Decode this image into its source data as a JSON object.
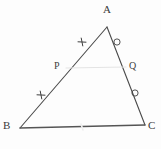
{
  "figure": {
    "name": "triangle-abc-midsegment",
    "background_color": "#fdfdfd",
    "stroke_color": "#4a4a4a",
    "faint_stroke_color": "#e2e2e2",
    "mark_color": "#3f3f3f"
  },
  "vertices": {
    "A": {
      "label": "A",
      "x": 107,
      "y": 27,
      "label_x": 103,
      "label_y": 4
    },
    "B": {
      "label": "B",
      "x": 20,
      "y": 128,
      "label_x": 3,
      "label_y": 120
    },
    "C": {
      "label": "C",
      "x": 145,
      "y": 125,
      "label_x": 148,
      "label_y": 120
    }
  },
  "points": {
    "P": {
      "label": "P",
      "x": 65,
      "y": 77,
      "label_x": 54,
      "label_y": 61
    },
    "Q": {
      "label": "Q",
      "x": 126,
      "y": 76,
      "label_x": 129,
      "label_y": 61
    }
  },
  "segments": [
    {
      "name": "side-ab",
      "from": "A",
      "to": "B",
      "x1": 107,
      "y1": 27,
      "x2": 20,
      "y2": 128,
      "style": "solid"
    },
    {
      "name": "side-ac",
      "from": "A",
      "to": "C",
      "x1": 107,
      "y1": 27,
      "x2": 145,
      "y2": 125,
      "style": "solid"
    },
    {
      "name": "side-bc",
      "from": "B",
      "to": "C",
      "x1": 20,
      "y1": 128,
      "x2": 145,
      "y2": 125,
      "style": "solid"
    },
    {
      "name": "segment-pq",
      "from": "P",
      "to": "Q",
      "x1": 66,
      "y1": 68,
      "x2": 126,
      "y2": 67,
      "style": "faint"
    }
  ],
  "congruence_marks": [
    {
      "name": "tick-mark-ap",
      "type": "cross-tick",
      "x": 82,
      "y": 42,
      "on_segment": "AP"
    },
    {
      "name": "tick-mark-pb",
      "type": "cross-tick",
      "x": 41,
      "y": 95,
      "on_segment": "PB"
    },
    {
      "name": "circle-mark-aq",
      "type": "circle",
      "x": 117,
      "y": 42,
      "on_segment": "AQ"
    },
    {
      "name": "circle-mark-qc",
      "type": "circle",
      "x": 135,
      "y": 93,
      "on_segment": "QC"
    },
    {
      "name": "tick-mark-bc",
      "type": "faint-tick",
      "x": 82,
      "y": 127,
      "on_segment": "BC"
    }
  ]
}
